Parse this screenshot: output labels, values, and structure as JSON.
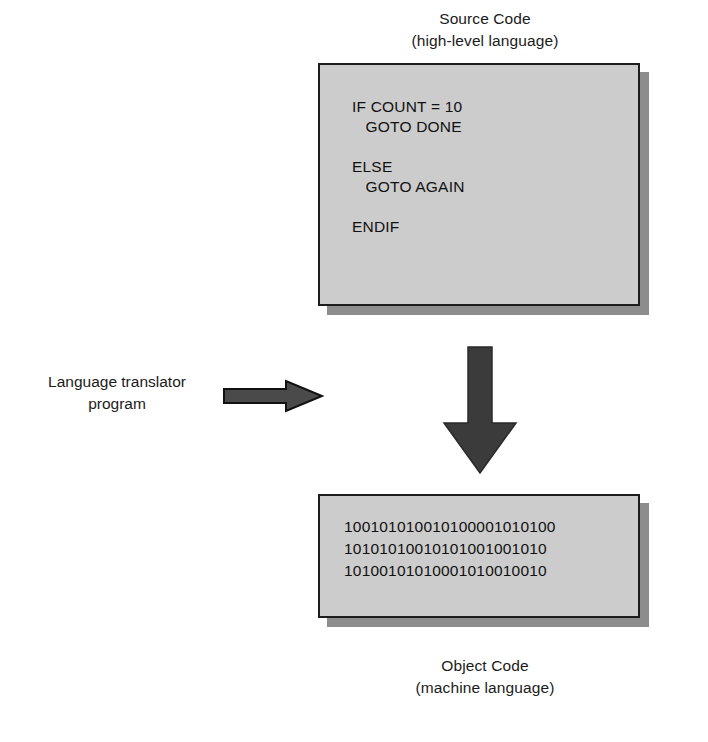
{
  "diagram": {
    "title_semantic": "language-translator-process",
    "source": {
      "caption_line1": "Source Code",
      "caption_line2": "(high-level language)",
      "code": "IF COUNT = 10\n   GOTO DONE\n\nELSE\n   GOTO AGAIN\n\nENDIF",
      "code_lines": [
        "IF COUNT = 10",
        "   GOTO DONE",
        "",
        "ELSE",
        "   GOTO AGAIN",
        "",
        "ENDIF"
      ]
    },
    "object": {
      "caption_line1": "Object Code",
      "caption_line2": "(machine language)",
      "code": "100101010010100001010100\n10101010010101001001010\n10100101010001010010010",
      "code_lines": [
        "100101010010100001010100",
        "10101010010101001001010",
        "10100101010001010010010"
      ]
    },
    "translator": {
      "label_line1": "Language translator",
      "label_line2": "program"
    },
    "arrows": {
      "right_arrow_name": "translator-arrow",
      "down_arrow_name": "compile-arrow"
    },
    "colors": {
      "box_fill": "#cccccc",
      "box_border": "#1d1d1d",
      "box_shadow": "#8d8d8d",
      "arrow_fill": "#4a4a4a",
      "arrow_outline": "#111111",
      "down_arrow_fill": "#3b3b3b",
      "text": "#111111",
      "background": "#ffffff"
    }
  }
}
